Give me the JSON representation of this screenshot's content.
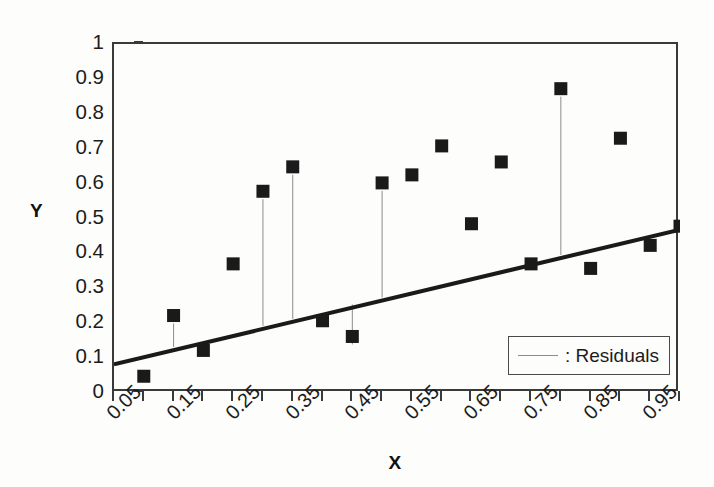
{
  "chart_data": {
    "type": "scatter",
    "title": "",
    "xlabel": "X",
    "ylabel": "Y",
    "xlim": [
      0.05,
      1.0
    ],
    "ylim": [
      0,
      1
    ],
    "grid": false,
    "legend_position": "bottom-right",
    "x_tick_labels": [
      "0.05",
      "0.15",
      "0.25",
      "0.35",
      "0.45",
      "0.55",
      "0.65",
      "0.75",
      "0.85",
      "0.95"
    ],
    "x_tick_values": [
      0.05,
      0.15,
      0.25,
      0.35,
      0.45,
      0.55,
      0.65,
      0.75,
      0.85,
      0.95
    ],
    "x_minor_tick_values": [
      0.1,
      0.2,
      0.3,
      0.4,
      0.5,
      0.6,
      0.7,
      0.8,
      0.9,
      1.0
    ],
    "y_tick_labels": [
      "0",
      "0.1",
      "0.2",
      "0.3",
      "0.4",
      "0.5",
      "0.6",
      "0.7",
      "0.8",
      "0.9",
      "1"
    ],
    "y_tick_values": [
      0,
      0.1,
      0.2,
      0.3,
      0.4,
      0.5,
      0.6,
      0.7,
      0.8,
      0.9,
      1
    ],
    "series": [
      {
        "name": "observations",
        "marker": "square",
        "color": "#1a1a1a",
        "x": [
          0.1,
          0.15,
          0.2,
          0.25,
          0.3,
          0.35,
          0.4,
          0.45,
          0.5,
          0.55,
          0.6,
          0.65,
          0.7,
          0.75,
          0.8,
          0.85,
          0.9,
          0.95,
          1.0
        ],
        "y": [
          0.048,
          0.222,
          0.122,
          0.37,
          0.578,
          0.648,
          0.207,
          0.162,
          0.602,
          0.625,
          0.708,
          0.485,
          0.662,
          0.37,
          0.872,
          0.357,
          0.73,
          0.423,
          0.478
        ]
      }
    ],
    "fit_line": {
      "name": "regression-line",
      "color": "#1a1a1a",
      "slope": 0.406,
      "intercept": 0.0617,
      "x_start": 0.05,
      "x_end": 1.0,
      "y_start": 0.082,
      "y_end": 0.468
    },
    "residuals": {
      "label": ": Residuals",
      "color": "#8c8c8c",
      "x": [
        0.15,
        0.3,
        0.35,
        0.45,
        0.5,
        0.8
      ],
      "y_point": [
        0.222,
        0.578,
        0.648,
        0.162,
        0.602,
        0.872
      ],
      "y_fit": [
        0.123,
        0.184,
        0.204,
        0.245,
        0.265,
        0.387
      ]
    }
  },
  "axes": {
    "y_title": "Y",
    "x_title": "X"
  },
  "legend": {
    "label": ": Residuals",
    "swatch_name": "residual-line-sample"
  }
}
